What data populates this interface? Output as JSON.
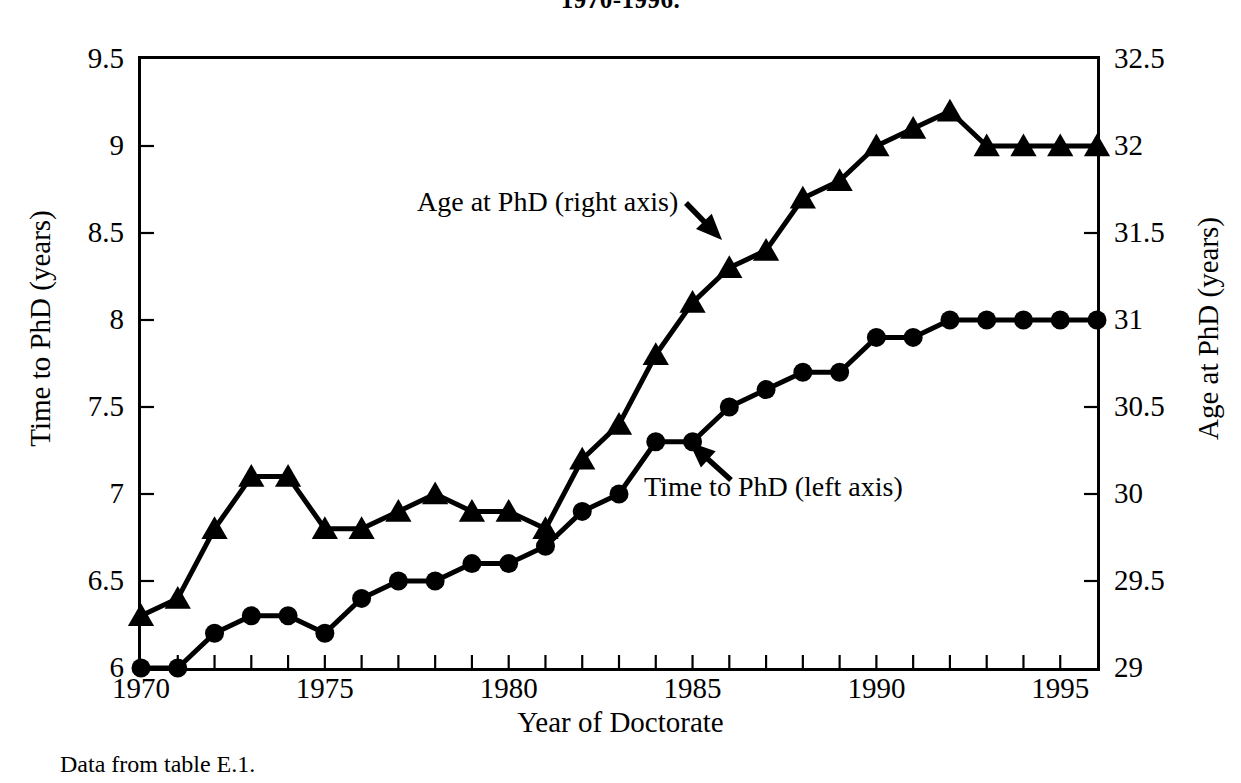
{
  "title": "1970-1996.",
  "footnote": "Data from table E.1.",
  "axes": {
    "x": {
      "title": "Year of Doctorate",
      "min": 1970,
      "max": 1996,
      "tick_labels": [
        "1970",
        "1975",
        "1980",
        "1985",
        "1990",
        "1995"
      ],
      "tick_values": [
        1970,
        1975,
        1980,
        1985,
        1990,
        1995
      ],
      "minor_tick_step": 1
    },
    "y_left": {
      "title": "Time to PhD (years)",
      "min": 6,
      "max": 9.5,
      "tick_labels": [
        "6",
        "6.5",
        "7",
        "7.5",
        "8",
        "8.5",
        "9",
        "9.5"
      ],
      "tick_values": [
        6,
        6.5,
        7,
        7.5,
        8,
        8.5,
        9,
        9.5
      ]
    },
    "y_right": {
      "title": "Age at PhD (years)",
      "min": 29,
      "max": 32.5,
      "tick_labels": [
        "29",
        "29.5",
        "30",
        "30.5",
        "31",
        "31.5",
        "32",
        "32.5"
      ],
      "tick_values": [
        29,
        29.5,
        30,
        30.5,
        31,
        31.5,
        32,
        32.5
      ]
    }
  },
  "annotations": [
    {
      "name": "age-at-phd",
      "text": "Age at PhD (right axis)",
      "arrow": "down-right"
    },
    {
      "name": "time-to-phd",
      "text": "Time to PhD (left axis)",
      "arrow": "up-left"
    }
  ],
  "colors": {
    "line": "#000000",
    "marker": "#000000",
    "axis": "#000000",
    "background": "#ffffff"
  },
  "chart_data": {
    "type": "line",
    "title": "1970-1996.",
    "xlabel": "Year of Doctorate",
    "ylabel": "Time to PhD (years)",
    "y2label": "Age at PhD (years)",
    "xlim": [
      1970,
      1996
    ],
    "ylim": [
      6,
      9.5
    ],
    "y2lim": [
      29,
      32.5
    ],
    "grid": false,
    "legend": "annotations-inline",
    "x": [
      1970,
      1971,
      1972,
      1973,
      1974,
      1975,
      1976,
      1977,
      1978,
      1979,
      1980,
      1981,
      1982,
      1983,
      1984,
      1985,
      1986,
      1987,
      1988,
      1989,
      1990,
      1991,
      1992,
      1993,
      1994,
      1995,
      1996
    ],
    "series": [
      {
        "name": "Time to PhD (left axis)",
        "axis": "left",
        "marker": "circle",
        "values": [
          6.0,
          6.0,
          6.2,
          6.3,
          6.3,
          6.2,
          6.4,
          6.5,
          6.5,
          6.6,
          6.6,
          6.7,
          6.9,
          7.0,
          7.3,
          7.3,
          7.5,
          7.6,
          7.7,
          7.7,
          7.9,
          7.9,
          8.0,
          8.0,
          8.0,
          8.0,
          8.0
        ]
      },
      {
        "name": "Age at PhD (right axis)",
        "axis": "right",
        "marker": "triangle",
        "values": [
          29.3,
          29.4,
          29.8,
          30.1,
          30.1,
          29.8,
          29.8,
          29.9,
          30.0,
          29.9,
          29.9,
          29.8,
          30.2,
          30.4,
          30.8,
          31.1,
          31.3,
          31.4,
          31.7,
          31.8,
          32.0,
          32.1,
          32.2,
          32.0,
          32.0,
          32.0,
          32.0
        ]
      }
    ]
  }
}
